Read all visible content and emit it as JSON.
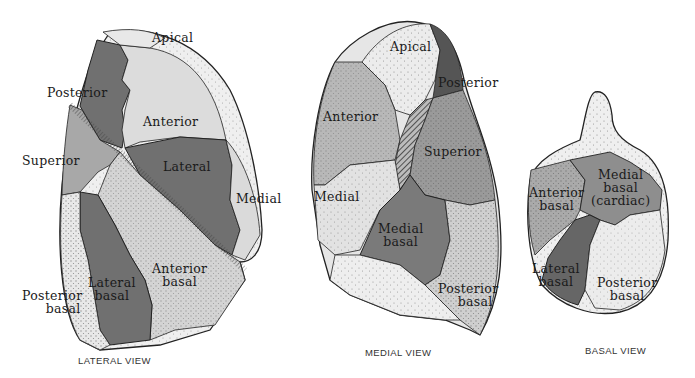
{
  "colors": {
    "dark": "#6e6e6e",
    "mid": "#a2a2a2",
    "light": "#d9d9d9",
    "pale": "#f0f0f0",
    "outline": "#222222"
  },
  "views": [
    {
      "id": "lateral",
      "caption": "LATERAL VIEW",
      "labels": {
        "apical": "Apical",
        "posterior": "Posterior",
        "anterior": "Anterior",
        "superior": "Superior",
        "lateral": "Lateral",
        "medial": "Medial",
        "lateral_basal_1": "Lateral",
        "lateral_basal_2": "basal",
        "anterior_basal_1": "Anterior",
        "anterior_basal_2": "basal",
        "posterior_basal_1": "Posterior",
        "posterior_basal_2": "basal"
      }
    },
    {
      "id": "medial",
      "caption": "MEDIAL VIEW",
      "labels": {
        "apical": "Apical",
        "posterior": "Posterior",
        "anterior": "Anterior",
        "superior": "Superior",
        "medial": "Medial",
        "medial_basal_1": "Medial",
        "medial_basal_2": "basal",
        "posterior_basal_1": "Posterior",
        "posterior_basal_2": "basal"
      }
    },
    {
      "id": "basal",
      "caption": "BASAL VIEW",
      "labels": {
        "anterior_basal_1": "Anterior",
        "anterior_basal_2": "basal",
        "medial_basal_1": "Medial",
        "medial_basal_2": "basal",
        "medial_basal_3": "(cardiac)",
        "lateral_basal_1": "Lateral",
        "lateral_basal_2": "basal",
        "posterior_basal_1": "Posterior",
        "posterior_basal_2": "basal"
      }
    }
  ]
}
